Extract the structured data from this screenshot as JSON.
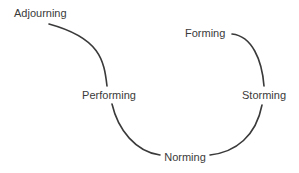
{
  "diagram": {
    "type": "cycle",
    "stages": [
      {
        "id": "forming",
        "label": "Forming"
      },
      {
        "id": "storming",
        "label": "Storming"
      },
      {
        "id": "norming",
        "label": "Norming"
      },
      {
        "id": "performing",
        "label": "Performing"
      },
      {
        "id": "adjourning",
        "label": "Adjourning"
      }
    ],
    "connections": [
      {
        "from": "forming",
        "to": "storming"
      },
      {
        "from": "storming",
        "to": "norming"
      },
      {
        "from": "norming",
        "to": "performing"
      },
      {
        "from": "performing",
        "to": "adjourning"
      }
    ],
    "colors": {
      "line": "#3a3a3a",
      "text": "#3a3a3a",
      "background": "#ffffff"
    }
  }
}
